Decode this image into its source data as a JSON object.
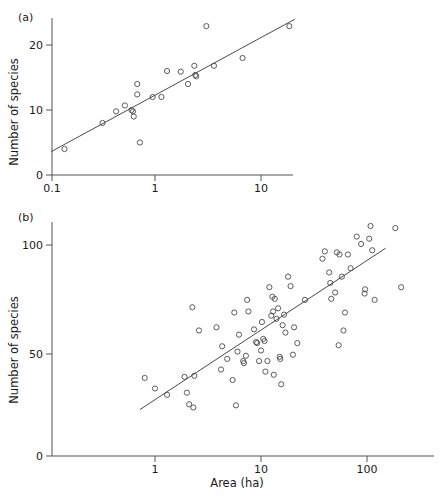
{
  "figure": {
    "background": "#ffffff",
    "marker_color": "#4a4a4a",
    "axis_color": "#555555",
    "line_color": "#4a4a4a"
  },
  "panels": [
    {
      "tag": "(a)",
      "ylabel": "Number of species",
      "xlabel": "",
      "y_ticks": [
        "0",
        "10",
        "20"
      ],
      "x_ticks": [
        "0.1",
        "1",
        "10"
      ]
    },
    {
      "tag": "(b)",
      "ylabel": "Number of species",
      "xlabel": "Area (ha)",
      "y_ticks": [
        "0",
        "50",
        "100"
      ],
      "x_ticks": [
        "1",
        "10",
        "100"
      ]
    }
  ],
  "chart_data": [
    {
      "type": "scatter",
      "panel": "(a)",
      "title": "",
      "xlabel": "",
      "ylabel": "Number of species",
      "xscale": "log",
      "yscale": "linear",
      "xlim": [
        0.1,
        23
      ],
      "ylim": [
        0,
        24
      ],
      "x_ticks": [
        0.1,
        1,
        10
      ],
      "y_ticks": [
        0,
        10,
        20
      ],
      "grid": false,
      "legend": "none",
      "points": [
        [
          0.14,
          4.0
        ],
        [
          0.32,
          8.0
        ],
        [
          0.43,
          9.8
        ],
        [
          0.52,
          10.7
        ],
        [
          0.6,
          10.0
        ],
        [
          0.62,
          9.8
        ],
        [
          0.63,
          9.0
        ],
        [
          0.68,
          14.0
        ],
        [
          0.68,
          12.4
        ],
        [
          0.72,
          5.0
        ],
        [
          0.95,
          12.0
        ],
        [
          1.15,
          12.0
        ],
        [
          1.3,
          16.0
        ],
        [
          1.75,
          15.9
        ],
        [
          2.05,
          14.0
        ],
        [
          2.35,
          16.8
        ],
        [
          2.4,
          15.4
        ],
        [
          2.45,
          15.2
        ],
        [
          3.05,
          22.9
        ],
        [
          3.6,
          16.8
        ],
        [
          6.7,
          18.0
        ],
        [
          18.5,
          22.9
        ]
      ],
      "fit_line": {
        "x": [
          0.105,
          21.0
        ],
        "y": [
          3.6,
          24.0
        ]
      }
    },
    {
      "type": "scatter",
      "panel": "(b)",
      "title": "",
      "xlabel": "Area (ha)",
      "ylabel": "Number of species",
      "xscale": "log",
      "yscale": "linear",
      "xlim": [
        0.55,
        260
      ],
      "ylim": [
        0,
        115
      ],
      "x_ticks": [
        1,
        10,
        100
      ],
      "y_ticks": [
        0,
        50,
        100
      ],
      "grid": false,
      "legend": "none",
      "points": [
        [
          0.8,
          37.0
        ],
        [
          1.0,
          32.0
        ],
        [
          1.3,
          29.0
        ],
        [
          1.9,
          37.5
        ],
        [
          2.0,
          30.0
        ],
        [
          2.1,
          24.5
        ],
        [
          2.3,
          23.0
        ],
        [
          2.35,
          38.0
        ],
        [
          2.25,
          70.5
        ],
        [
          2.6,
          59.5
        ],
        [
          3.8,
          61.0
        ],
        [
          4.3,
          52.0
        ],
        [
          4.2,
          41.0
        ],
        [
          4.8,
          46.0
        ],
        [
          5.6,
          68.0
        ],
        [
          5.4,
          36.0
        ],
        [
          5.8,
          24.0
        ],
        [
          6.0,
          49.5
        ],
        [
          6.2,
          57.5
        ],
        [
          6.8,
          45.0
        ],
        [
          6.9,
          44.0
        ],
        [
          7.2,
          47.5
        ],
        [
          7.4,
          74.0
        ],
        [
          7.6,
          68.5
        ],
        [
          8.6,
          60.0
        ],
        [
          9.0,
          54.0
        ],
        [
          9.2,
          53.5
        ],
        [
          9.6,
          45.0
        ],
        [
          10.0,
          50.0
        ],
        [
          10.2,
          63.5
        ],
        [
          10.5,
          55.5
        ],
        [
          10.8,
          54.5
        ],
        [
          11.0,
          40.0
        ],
        [
          11.5,
          45.0
        ],
        [
          12.0,
          80.0
        ],
        [
          12.5,
          66.5
        ],
        [
          12.8,
          75.5
        ],
        [
          13.0,
          68.5
        ],
        [
          13.2,
          38.5
        ],
        [
          13.5,
          74.5
        ],
        [
          14.0,
          65.0
        ],
        [
          14.5,
          70.0
        ],
        [
          15.0,
          47.0
        ],
        [
          15.2,
          46.0
        ],
        [
          15.5,
          34.0
        ],
        [
          16.0,
          62.0
        ],
        [
          16.5,
          67.0
        ],
        [
          17.0,
          58.5
        ],
        [
          18.0,
          85.0
        ],
        [
          19.0,
          80.5
        ],
        [
          20.0,
          48.0
        ],
        [
          20.5,
          61.0
        ],
        [
          22.0,
          53.5
        ],
        [
          26.0,
          74.0
        ],
        [
          38.0,
          93.5
        ],
        [
          40.0,
          97.0
        ],
        [
          44.0,
          87.0
        ],
        [
          45.0,
          82.0
        ],
        [
          46.0,
          74.5
        ],
        [
          50.0,
          77.5
        ],
        [
          52.0,
          96.5
        ],
        [
          55.0,
          95.5
        ],
        [
          54.0,
          52.5
        ],
        [
          58.0,
          85.0
        ],
        [
          60.0,
          59.5
        ],
        [
          62.0,
          68.0
        ],
        [
          66.0,
          95.5
        ],
        [
          70.0,
          89.0
        ],
        [
          80.0,
          104.0
        ],
        [
          88.0,
          100.5
        ],
        [
          95.0,
          77.0
        ],
        [
          96.0,
          79.0
        ],
        [
          105.0,
          103.0
        ],
        [
          108.0,
          109.0
        ],
        [
          112.0,
          97.5
        ],
        [
          118.0,
          74.0
        ],
        [
          185.0,
          108.0
        ],
        [
          210.0,
          80.0
        ]
      ],
      "fit_line": {
        "x": [
          0.72,
          150.0
        ],
        "y": [
          22.0,
          98.5
        ]
      }
    }
  ]
}
